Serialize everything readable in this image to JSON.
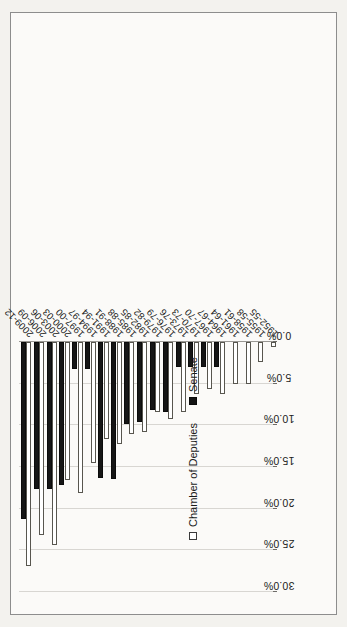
{
  "chart_data": {
    "type": "bar",
    "orientation": "vertical-rotated",
    "title": "",
    "subtitle": "",
    "xlabel": "",
    "ylabel": "",
    "ylim": [
      0,
      30
    ],
    "grid": true,
    "legend_position": "inside-left",
    "tick_labels": [
      "30.0%",
      "25.0%",
      "20.0%",
      "15.0%",
      "10.0%",
      "5.0%",
      "0.0%"
    ],
    "tick_values": [
      30,
      25,
      20,
      15,
      10,
      5,
      0
    ],
    "categories": [
      "2009-12",
      "2006-09",
      "2003-06",
      "2000-03",
      "1997-00",
      "1994-97",
      "1991-94",
      "1988-91",
      "1985-88",
      "1982-85",
      "1979-82",
      "1976-79",
      "1973-76",
      "1970-73",
      "1967-70",
      "1964-67",
      "1961-64",
      "1958-61",
      "1955-58",
      "1952-55"
    ],
    "series": [
      {
        "name": "Chamber of Deputies",
        "color": "#ffffff",
        "values": [
          26.9,
          23.2,
          24.4,
          16.6,
          18.1,
          14.5,
          11.7,
          12.3,
          11.0,
          10.8,
          8.4,
          9.2,
          8.4,
          6.2,
          5.7,
          6.2,
          5.0,
          5.0,
          2.4,
          0.6
        ]
      },
      {
        "name": "Senate",
        "color": "#161616",
        "values": [
          21.2,
          17.7,
          17.7,
          17.2,
          3.2,
          3.3,
          16.3,
          16.4,
          9.8,
          9.6,
          8.2,
          8.4,
          3.0,
          3.0,
          3.0,
          3.0,
          0,
          0,
          0,
          0
        ]
      }
    ]
  },
  "legend": {
    "items": [
      {
        "label": "Chamber of Deputies",
        "swatch": "hollow-square"
      },
      {
        "label": "Senate",
        "swatch": "filled-square"
      }
    ]
  },
  "colors": {
    "deputies_fill": "#ffffff",
    "deputies_stroke": "#58564f",
    "senate_fill": "#161616",
    "grid": "#d8d6d2",
    "axis": "#9a9894",
    "frame_border": "#8d8d8d",
    "plot_background": "#fbfaf8",
    "page_background": "#f3f2ee",
    "text": "#1a1a1a"
  }
}
